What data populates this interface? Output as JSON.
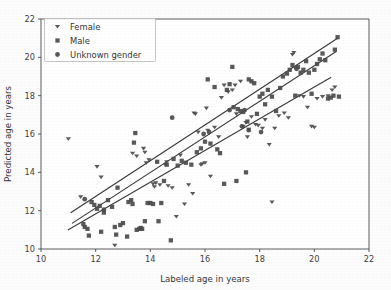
{
  "chart_data": {
    "type": "scatter",
    "title": "",
    "xlabel": "Labeled age in years",
    "ylabel": "Predicted age in years",
    "xlim": [
      10,
      22
    ],
    "ylim": [
      10,
      22
    ],
    "xticks": [
      10,
      12,
      14,
      16,
      18,
      20,
      22
    ],
    "yticks": [
      10,
      12,
      14,
      16,
      18,
      20,
      22
    ],
    "grid": false,
    "legend_position": "upper left",
    "legend": [
      {
        "label": "Female",
        "marker": "triangle-down-marker",
        "color": "#4b4b4b"
      },
      {
        "label": "Male",
        "marker": "square-marker",
        "color": "#4b4b4b"
      },
      {
        "label": "Unknown gender",
        "marker": "circle-marker",
        "color": "#4b4b4b"
      }
    ],
    "series": [
      {
        "name": "Female",
        "marker": "triangle-down-marker",
        "color": "#4b4b4b",
        "points": [
          [
            11.0,
            15.75
          ],
          [
            11.45,
            12.72
          ],
          [
            12.05,
            14.3
          ],
          [
            12.2,
            13.75
          ],
          [
            12.7,
            10.2
          ],
          [
            13.35,
            15.0
          ],
          [
            13.5,
            14.85
          ],
          [
            13.75,
            15.25
          ],
          [
            13.8,
            15.05
          ],
          [
            13.85,
            14.5
          ],
          [
            13.95,
            14.65
          ],
          [
            14.1,
            13.4
          ],
          [
            14.15,
            13.25
          ],
          [
            14.2,
            13.45
          ],
          [
            14.35,
            13.35
          ],
          [
            14.55,
            14.4
          ],
          [
            14.6,
            14.55
          ],
          [
            14.65,
            13.3
          ],
          [
            14.8,
            13.2
          ],
          [
            14.95,
            11.7
          ],
          [
            15.1,
            14.9
          ],
          [
            15.25,
            12.35
          ],
          [
            15.4,
            13.35
          ],
          [
            15.55,
            12.9
          ],
          [
            15.6,
            17.1
          ],
          [
            15.65,
            17.05
          ],
          [
            15.75,
            16.1
          ],
          [
            15.85,
            14.4
          ],
          [
            15.9,
            14.45
          ],
          [
            16.0,
            14.5
          ],
          [
            16.05,
            17.35
          ],
          [
            16.1,
            16.2
          ],
          [
            16.2,
            13.8
          ],
          [
            16.35,
            16.35
          ],
          [
            16.5,
            15.85
          ],
          [
            16.6,
            17.9
          ],
          [
            16.7,
            18.55
          ],
          [
            16.85,
            18.2
          ],
          [
            17.0,
            18.3
          ],
          [
            17.1,
            18.55
          ],
          [
            17.15,
            17.05
          ],
          [
            17.3,
            18.75
          ],
          [
            17.4,
            16.4
          ],
          [
            17.5,
            16.6
          ],
          [
            17.55,
            15.85
          ],
          [
            17.6,
            16.25
          ],
          [
            17.7,
            16.9
          ],
          [
            17.85,
            16.5
          ],
          [
            17.95,
            16.45
          ],
          [
            18.1,
            16.3
          ],
          [
            18.2,
            16.75
          ],
          [
            18.35,
            15.45
          ],
          [
            18.45,
            12.45
          ],
          [
            18.55,
            16.3
          ],
          [
            18.7,
            16.95
          ],
          [
            18.9,
            17.1
          ],
          [
            19.05,
            16.85
          ],
          [
            19.2,
            20.15
          ],
          [
            19.25,
            20.25
          ],
          [
            19.3,
            19.45
          ],
          [
            19.45,
            18.0
          ],
          [
            19.6,
            17.95
          ],
          [
            19.75,
            17.4
          ],
          [
            19.9,
            16.4
          ],
          [
            20.0,
            16.35
          ],
          [
            20.1,
            17.85
          ],
          [
            20.3,
            17.95
          ],
          [
            20.5,
            18.0
          ],
          [
            20.65,
            18.3
          ],
          [
            20.75,
            18.45
          ]
        ]
      },
      {
        "name": "Male",
        "marker": "square-marker",
        "color": "#4b4b4b",
        "points": [
          [
            11.55,
            11.3
          ],
          [
            11.6,
            11.15
          ],
          [
            11.7,
            11.05
          ],
          [
            11.75,
            10.7
          ],
          [
            11.85,
            12.45
          ],
          [
            11.95,
            12.3
          ],
          [
            12.05,
            12.1
          ],
          [
            12.15,
            12.25
          ],
          [
            12.2,
            10.9
          ],
          [
            12.3,
            11.9
          ],
          [
            12.45,
            12.55
          ],
          [
            12.6,
            12.2
          ],
          [
            12.7,
            11.15
          ],
          [
            12.75,
            10.75
          ],
          [
            12.8,
            13.2
          ],
          [
            12.9,
            11.25
          ],
          [
            13.0,
            11.35
          ],
          [
            13.15,
            10.65
          ],
          [
            13.2,
            12.45
          ],
          [
            13.3,
            12.55
          ],
          [
            13.35,
            12.35
          ],
          [
            13.4,
            15.55
          ],
          [
            13.45,
            16.05
          ],
          [
            13.5,
            11.0
          ],
          [
            13.6,
            11.05
          ],
          [
            13.65,
            11.1
          ],
          [
            13.7,
            11.05
          ],
          [
            13.8,
            11.45
          ],
          [
            13.9,
            12.4
          ],
          [
            14.0,
            12.4
          ],
          [
            14.1,
            12.35
          ],
          [
            14.25,
            14.55
          ],
          [
            14.3,
            11.45
          ],
          [
            14.4,
            12.4
          ],
          [
            14.5,
            13.55
          ],
          [
            14.6,
            14.4
          ],
          [
            14.75,
            10.45
          ],
          [
            14.85,
            14.7
          ],
          [
            15.0,
            14.35
          ],
          [
            15.15,
            14.6
          ],
          [
            15.3,
            14.5
          ],
          [
            15.5,
            14.4
          ],
          [
            15.7,
            15.05
          ],
          [
            15.85,
            15.25
          ],
          [
            16.0,
            15.6
          ],
          [
            16.1,
            18.85
          ],
          [
            16.2,
            15.5
          ],
          [
            16.35,
            18.45
          ],
          [
            16.45,
            15.2
          ],
          [
            16.55,
            15.0
          ],
          [
            16.7,
            13.4
          ],
          [
            16.8,
            18.3
          ],
          [
            16.9,
            18.6
          ],
          [
            17.0,
            19.5
          ],
          [
            17.05,
            17.4
          ],
          [
            17.15,
            13.55
          ],
          [
            17.2,
            17.3
          ],
          [
            17.3,
            17.2
          ],
          [
            17.4,
            17.15
          ],
          [
            17.5,
            14.0
          ],
          [
            17.55,
            16.65
          ],
          [
            17.6,
            18.85
          ],
          [
            17.7,
            18.75
          ],
          [
            17.8,
            18.65
          ],
          [
            17.9,
            17.05
          ],
          [
            18.0,
            17.95
          ],
          [
            18.1,
            18.1
          ],
          [
            18.2,
            17.55
          ],
          [
            18.3,
            18.3
          ],
          [
            18.45,
            17.95
          ],
          [
            18.6,
            17.2
          ],
          [
            18.75,
            18.4
          ],
          [
            18.85,
            19.0
          ],
          [
            19.0,
            19.15
          ],
          [
            19.1,
            19.35
          ],
          [
            19.2,
            19.6
          ],
          [
            19.3,
            18.0
          ],
          [
            19.4,
            19.5
          ],
          [
            19.5,
            19.2
          ],
          [
            19.6,
            19.35
          ],
          [
            19.7,
            19.8
          ],
          [
            19.8,
            19.2
          ],
          [
            19.9,
            18.1
          ],
          [
            20.0,
            19.35
          ],
          [
            20.1,
            19.65
          ],
          [
            20.2,
            19.9
          ],
          [
            20.3,
            20.2
          ],
          [
            20.4,
            19.85
          ],
          [
            20.5,
            17.85
          ],
          [
            20.6,
            17.9
          ],
          [
            20.7,
            18.0
          ],
          [
            20.85,
            21.05
          ],
          [
            20.75,
            20.4
          ],
          [
            20.9,
            17.95
          ]
        ]
      },
      {
        "name": "Unknown gender",
        "marker": "circle-marker",
        "color": "#4b4b4b",
        "points": [
          [
            11.6,
            12.6
          ],
          [
            14.8,
            16.85
          ],
          [
            16.15,
            16.1
          ],
          [
            16.9,
            17.25
          ],
          [
            17.35,
            16.4
          ],
          [
            17.45,
            17.25
          ],
          [
            17.6,
            16.2
          ],
          [
            18.05,
            16.1
          ],
          [
            12.3,
            12.05
          ],
          [
            15.95,
            16.0
          ],
          [
            19.35,
            19.4
          ]
        ]
      }
    ],
    "regression_lines": [
      {
        "name": "line-upper",
        "x0": 11.1,
        "y0": 11.9,
        "x1": 20.85,
        "y1": 21.0
      },
      {
        "name": "line-middle",
        "x0": 11.15,
        "y0": 11.35,
        "x1": 20.8,
        "y1": 20.3
      },
      {
        "name": "line-lower",
        "x0": 11.0,
        "y0": 11.0,
        "x1": 20.6,
        "y1": 18.95
      }
    ]
  },
  "axes": {
    "x_title": "Labeled age in years",
    "y_title": "Predicted age in years",
    "x_tick_labels": [
      "10",
      "12",
      "14",
      "16",
      "18",
      "20",
      "22"
    ],
    "y_tick_labels": [
      "10",
      "12",
      "14",
      "16",
      "18",
      "20",
      "22"
    ]
  },
  "legend": {
    "items": [
      {
        "label": "Female"
      },
      {
        "label": "Male"
      },
      {
        "label": "Unknown gender"
      }
    ]
  },
  "colors": {
    "marker": "#4b4b4b",
    "line": "#3b3b3b",
    "spine": "#4a4a4a",
    "text": "#353535",
    "background": "#fdfdfd"
  }
}
